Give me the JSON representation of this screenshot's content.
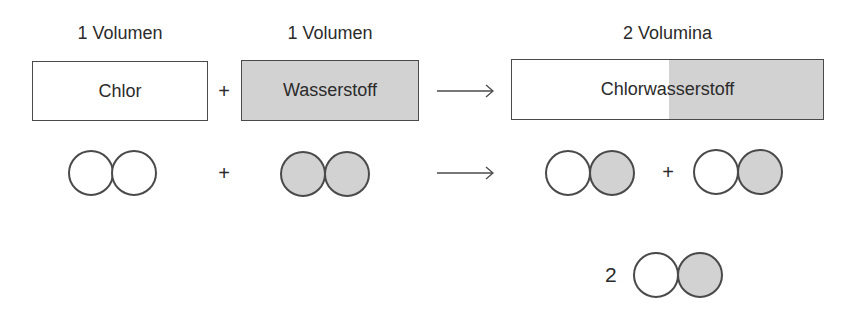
{
  "diagram": {
    "colors": {
      "white_atom": "#ffffff",
      "gray_atom": "#d2d2d2",
      "outline": "#4a4a4a",
      "text": "#2b2b2b"
    },
    "headings": {
      "chlor_volume": "1 Volumen",
      "wasserstoff_volume": "1 Volumen",
      "product_volume": "2 Volumina"
    },
    "boxes": {
      "chlor": "Chlor",
      "wasserstoff": "Wasserstoff",
      "chlorwasserstoff": "Chlorwasserstoff"
    },
    "operators": {
      "plus_top": "+",
      "plus_mid": "+",
      "plus_products": "+",
      "coefficient": "2"
    },
    "molecules": [
      {
        "name": "Cl2",
        "atoms": [
          "white",
          "white"
        ]
      },
      {
        "name": "H2",
        "atoms": [
          "gray",
          "gray"
        ]
      },
      {
        "name": "HCl",
        "atoms": [
          "white",
          "gray"
        ]
      },
      {
        "name": "HCl",
        "atoms": [
          "white",
          "gray"
        ]
      },
      {
        "name": "2 HCl",
        "atoms": [
          "white",
          "gray"
        ]
      }
    ]
  }
}
